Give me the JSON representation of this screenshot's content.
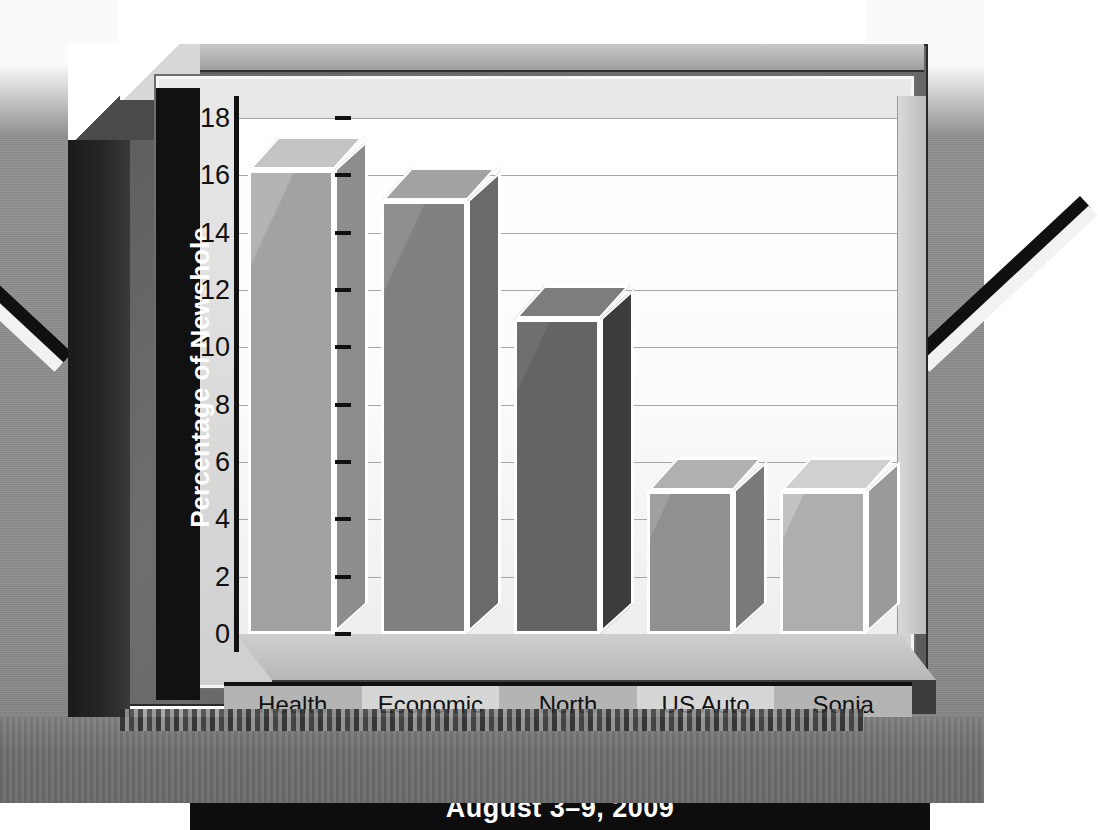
{
  "chart_data": {
    "type": "bar",
    "title": "",
    "top_cropped_text": "",
    "caption": "August 3–9, 2009",
    "xlabel": "",
    "ylabel": "Percentage of Newshole",
    "categories": [
      "Health Care Debate",
      "Economic Crisis",
      "North Korea",
      "US Auto Industry",
      "Sonia Sotomayor"
    ],
    "category_lines": [
      [
        "Health",
        "Care",
        "Debate"
      ],
      [
        "Economic",
        "Crisis"
      ],
      [
        "North",
        "Korea"
      ],
      [
        "US Auto",
        "Industry"
      ],
      [
        "Sonia",
        "Sotomayor"
      ]
    ],
    "values": [
      16.2,
      15.1,
      11.0,
      5.0,
      5.0
    ],
    "ylim": [
      0,
      18
    ],
    "ytick_labels": [
      "18",
      "16",
      "14",
      "12",
      "10",
      "8",
      "6",
      "4",
      "2",
      "0"
    ],
    "ytick_values": [
      18,
      16,
      14,
      12,
      10,
      8,
      6,
      4,
      2,
      0
    ],
    "grid": true,
    "legend": "none",
    "style": "3d-bar",
    "bar_colors": [
      "#b4b4b4",
      "#8f8f8f",
      "#6f6f6f",
      "#a0a0a0",
      "#c2c2c2"
    ],
    "bar_side_colors": [
      "#8d8d8d",
      "#6a6a6a",
      "#3c3c3c",
      "#7a7a7a",
      "#9a9a9a"
    ],
    "bar_top_colors": [
      "#c4c4c4",
      "#a2a2a2",
      "#7d7d7d",
      "#b0b0b0",
      "#d0d0d0"
    ]
  },
  "palette": {
    "frame_dark": "#1a1a1a",
    "frame_mid": "#5c5c5c",
    "plot_bg": "#fbfbfb",
    "grid": "#a6a6a6",
    "text": "#111111",
    "caption_bg": "#0d0d0d",
    "caption_fg": "#ffffff",
    "band_dark": "#b4b4b4",
    "band_light": "#d6d6d6",
    "page_bg": "#ffffff"
  }
}
